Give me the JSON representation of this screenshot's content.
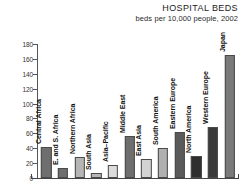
{
  "chart_data": {
    "type": "bar",
    "title": "HOSPITAL BEDS",
    "subtitle": "beds per 10,000 people, 2002",
    "xlabel": "",
    "ylabel": "",
    "ylim": [
      0,
      180
    ],
    "ytick_step": 20,
    "grid": false,
    "legend": "none",
    "categories": [
      "Central Africa",
      "E. and S. Africa",
      "Northern Africa",
      "South Asia",
      "Asia–Pacific",
      "Middle East",
      "East Asia",
      "South America",
      "Eastern Europe",
      "North America",
      "Western Europe",
      "Japan"
    ],
    "values": [
      42,
      13,
      28,
      7,
      17,
      56,
      25,
      40,
      62,
      29,
      68,
      165
    ],
    "ytick_labels": [
      "0",
      "20",
      "40",
      "60",
      "80",
      "100",
      "120",
      "140",
      "160",
      "180"
    ],
    "bar_colors": [
      "#6e6e6e",
      "#6e6e6e",
      "#b5b5b5",
      "#b5b5b5",
      "#dcdcdc",
      "#6e6e6e",
      "#d2d2d2",
      "#b0b0b0",
      "#5a5a5a",
      "#2e2e2e",
      "#3a3a3a",
      "#7a7a7a"
    ]
  },
  "colors": {
    "axis": "#4a4a4a",
    "text": "#1a1a1a",
    "background": "#ffffff"
  }
}
